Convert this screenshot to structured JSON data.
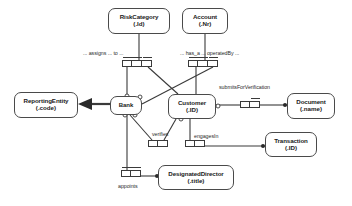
{
  "diagram": {
    "type": "object-role-model",
    "colors": {
      "stroke": "#4a4a4a",
      "line": "#3a3a3a",
      "text": "#1a1a1a",
      "background": "#ffffff"
    }
  },
  "entities": [
    {
      "id": "riskcategory",
      "name": "RiskCategory",
      "ref": "(.Id)",
      "x": 108,
      "y": 8,
      "w": 62,
      "h": 26
    },
    {
      "id": "account",
      "name": "Account",
      "ref": "(.Nr)",
      "x": 182,
      "y": 8,
      "w": 46,
      "h": 26
    },
    {
      "id": "reportingentity",
      "name": "ReportingEntity",
      "ref": "(.code)",
      "x": 14,
      "y": 92,
      "w": 64,
      "h": 26
    },
    {
      "id": "bank",
      "name": "Bank",
      "ref": "",
      "x": 110,
      "y": 96,
      "w": 32,
      "h": 19
    },
    {
      "id": "customer",
      "name": "Customer",
      "ref": "(.ID)",
      "x": 168,
      "y": 94,
      "w": 48,
      "h": 25
    },
    {
      "id": "document",
      "name": "Document",
      "ref": "(.name)",
      "x": 287,
      "y": 93,
      "w": 48,
      "h": 26
    },
    {
      "id": "transaction",
      "name": "Transaction",
      "ref": "(.ID)",
      "x": 265,
      "y": 132,
      "w": 52,
      "h": 25
    },
    {
      "id": "designateddirector",
      "name": "DesignatedDirector",
      "ref": "(.title)",
      "x": 158,
      "y": 165,
      "w": 76,
      "h": 25
    }
  ],
  "predicates": [
    {
      "id": "assigns-to",
      "label": "... assigns ... to ...",
      "label_x": 83,
      "label_y": 50,
      "box_x": 122,
      "box_y": 60,
      "cells": 3,
      "cell_w": 10,
      "cell_h": 7
    },
    {
      "id": "has-a-operated-by",
      "label": "... has_a ... operatedBy ...",
      "label_x": 180,
      "label_y": 50,
      "box_x": 188,
      "box_y": 60,
      "cells": 3,
      "cell_w": 10,
      "cell_h": 7
    },
    {
      "id": "submits-for-verification",
      "label": "submitsForVerification",
      "label_x": 219,
      "label_y": 84,
      "box_x": 240,
      "box_y": 101,
      "cells": 2,
      "cell_w": 10,
      "cell_h": 7
    },
    {
      "id": "verifies",
      "label": "verifies",
      "label_x": 152,
      "label_y": 131,
      "box_x": 148,
      "box_y": 140,
      "cells": 2,
      "cell_w": 10,
      "cell_h": 7
    },
    {
      "id": "engages-in",
      "label": "engagesIn",
      "label_x": 194,
      "label_y": 133,
      "box_x": 185,
      "box_y": 140,
      "cells": 2,
      "cell_w": 10,
      "cell_h": 7
    },
    {
      "id": "appoints",
      "label": "appoints",
      "label_x": 118,
      "label_y": 185,
      "box_x": 121,
      "box_y": 170,
      "cells": 2,
      "cell_w": 10,
      "cell_h": 7
    }
  ],
  "relationships": [
    {
      "id": "riskcategory-to-predicate",
      "from": "riskcategory",
      "to": "assigns-to"
    },
    {
      "id": "account-to-predicate",
      "from": "account",
      "to": "has-a-operated-by"
    },
    {
      "id": "bank-subtype-reportingentity",
      "from": "bank",
      "to": "reportingentity",
      "marker": "thick-arrow"
    },
    {
      "id": "bank-assigns-riskcategory",
      "from": "bank",
      "to": "assigns-to"
    },
    {
      "id": "customer-assigned-riskcategory",
      "from": "customer",
      "to": "assigns-to"
    },
    {
      "id": "customer-has-account",
      "from": "customer",
      "to": "has-a-operated-by"
    },
    {
      "id": "bank-operates-account",
      "from": "bank",
      "to": "has-a-operated-by"
    },
    {
      "id": "customer-submits-document",
      "from": "customer",
      "to": "submits-for-verification"
    },
    {
      "id": "bank-verifies",
      "from": "bank",
      "to": "verifies"
    },
    {
      "id": "customer-verified",
      "from": "customer",
      "to": "verifies"
    },
    {
      "id": "customer-engages-transaction",
      "from": "customer",
      "to": "engages-in"
    },
    {
      "id": "bank-appoints-director",
      "from": "bank",
      "to": "appoints"
    }
  ]
}
